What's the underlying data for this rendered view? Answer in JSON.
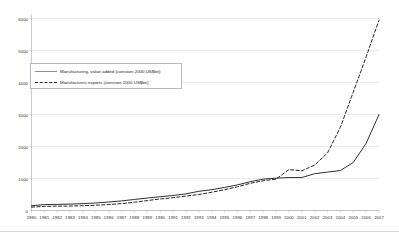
{
  "chart_data": {
    "type": "line",
    "title": "",
    "xlabel": "",
    "ylabel": "",
    "ylim": [
      0,
      6000
    ],
    "yticks": [
      0,
      1000,
      2000,
      3000,
      4000,
      5000,
      6000
    ],
    "ytick_labels": [
      "0",
      "1000",
      "2000",
      "3000",
      "4000",
      "5000",
      "6000"
    ],
    "grid": true,
    "legend_position": "upper-left",
    "categories": [
      "1980",
      "1981",
      "1982",
      "1983",
      "1984",
      "1985",
      "1986",
      "1987",
      "1988",
      "1989",
      "1990",
      "1991",
      "1992",
      "1993",
      "1994",
      "1995",
      "1996",
      "1997",
      "1998",
      "1999",
      "2000",
      "2001",
      "2002",
      "2003",
      "2004",
      "2005",
      "2006",
      "2007"
    ],
    "series": [
      {
        "name": "Manufacturing, value added (constant 2000 US$bn)",
        "style": "solid",
        "color": "#303030",
        "values": [
          150,
          185,
          190,
          200,
          215,
          235,
          265,
          300,
          345,
          390,
          430,
          470,
          520,
          600,
          650,
          720,
          800,
          900,
          980,
          1010,
          1030,
          1030,
          1150,
          1200,
          1250,
          1500,
          2100,
          3000
        ]
      },
      {
        "name": "Manufactures exports (constant 2000 US$bn)",
        "style": "dashed",
        "color": "#1a1a1a",
        "values": [
          105,
          130,
          135,
          140,
          150,
          165,
          185,
          215,
          260,
          310,
          360,
          400,
          450,
          500,
          570,
          650,
          740,
          850,
          930,
          980,
          1280,
          1240,
          1420,
          1800,
          2600,
          3700,
          4800,
          5950
        ]
      }
    ]
  },
  "legend": {
    "items": [
      {
        "label": "Manufacturing, value added (constant 2000 US$bn)",
        "style": "solid"
      },
      {
        "label": "Manufactures exports (constant 2000 US$bn)",
        "style": "dashed"
      }
    ]
  },
  "colors": {
    "grid": "#d9d9e0",
    "axis": "#a8a8b0",
    "solid_series": "#303030",
    "dashed_series": "#1a1a1a",
    "text": "#1e1e1e"
  }
}
